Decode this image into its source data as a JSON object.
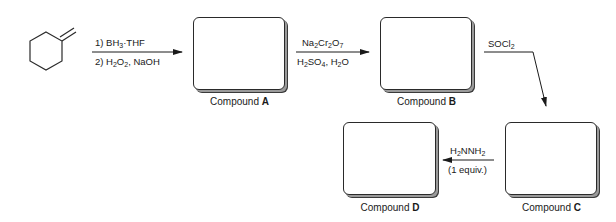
{
  "diagram": {
    "type": "reaction-scheme",
    "starting_material": {
      "name": "methylenecyclohexane",
      "depiction": "cyclohexane ring with exocyclic C=CH2 double bond"
    },
    "steps": [
      {
        "from": "starting_material",
        "to": "compound_a",
        "reagents_above": {
          "prefix": "1) BH",
          "sub1": "3",
          "suffix": "·THF"
        },
        "reagents_below": {
          "prefix": "2) H",
          "sub1": "2",
          "mid": "O",
          "sub2": "2",
          "suffix": ", NaOH"
        }
      },
      {
        "from": "compound_a",
        "to": "compound_b",
        "reagents_above": {
          "p1": "Na",
          "s1": "2",
          "p2": "Cr",
          "s2": "2",
          "p3": "O",
          "s3": "7"
        },
        "reagents_below": {
          "p1": "H",
          "s1": "2",
          "p2": "SO",
          "s2": "4",
          "p3": ", H",
          "s3": "2",
          "p4": "O"
        }
      },
      {
        "from": "compound_b",
        "to": "compound_c",
        "reagents_above": {
          "p1": "SOCl",
          "s1": "2"
        }
      },
      {
        "from": "compound_c",
        "to": "compound_d",
        "reagents_above": {
          "p1": "H",
          "s1": "2",
          "p2": "NNH",
          "s2": "2"
        },
        "reagents_below": "(1 equiv.)"
      }
    ],
    "compounds": {
      "a": {
        "prefix": "Compound ",
        "letter": "A"
      },
      "b": {
        "prefix": "Compound ",
        "letter": "B"
      },
      "c": {
        "prefix": "Compound ",
        "letter": "C"
      },
      "d": {
        "prefix": "Compound ",
        "letter": "D"
      }
    },
    "colors": {
      "line": "#1a1a1a",
      "shadow": "#9a9a9a",
      "background": "#ffffff"
    }
  }
}
